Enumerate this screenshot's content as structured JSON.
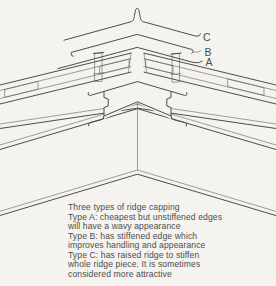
{
  "figure": {
    "title": "Three types of ridge capping",
    "labels": {
      "c": "C",
      "b": "B",
      "a": "A"
    },
    "caption": {
      "lines": [
        "Three types of ridge capping",
        "Type A: cheapest but unstiffened edges",
        "will have a wavy appearance",
        "Type B: has stiffened edge which",
        "improves handling and appearance",
        "Type C: has raised ridge to stiffen",
        "whole ridge piece. It is sometimes",
        "considered more attractive"
      ]
    },
    "colors": {
      "ink": "#4d4c48",
      "background": "#f4f3f0"
    }
  }
}
